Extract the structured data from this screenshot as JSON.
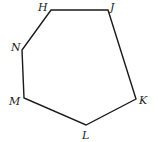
{
  "diagram": {
    "type": "polygon",
    "shape": "heptagon-like hexagon",
    "stroke_color": "#1a1a1a",
    "background": "#ffffff",
    "vertices": [
      {
        "label": "H",
        "x": 51,
        "y": 10
      },
      {
        "label": "J",
        "x": 108,
        "y": 10
      },
      {
        "label": "K",
        "x": 136,
        "y": 99
      },
      {
        "label": "L",
        "x": 86,
        "y": 125
      },
      {
        "label": "M",
        "x": 24,
        "y": 98
      },
      {
        "label": "N",
        "x": 22,
        "y": 50
      }
    ],
    "labels": {
      "H": "H",
      "J": "J",
      "K": "K",
      "L": "L",
      "M": "M",
      "N": "N"
    }
  }
}
